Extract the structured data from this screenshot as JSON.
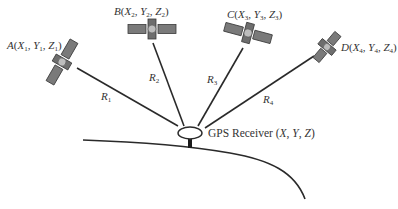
{
  "diagram": {
    "satellites": [
      {
        "id": "A",
        "label": "A(X1, Y1, Z1)",
        "letter": "A",
        "sub": "1",
        "cx": 62,
        "cy": 62,
        "angle": -60
      },
      {
        "id": "B",
        "label": "B(X2, Y2, Z2)",
        "letter": "B",
        "sub": "2",
        "cx": 152,
        "cy": 29,
        "angle": 0
      },
      {
        "id": "C",
        "label": "C(X3, Y3, Z3)",
        "letter": "C",
        "sub": "3",
        "cx": 248,
        "cy": 33,
        "angle": 15
      },
      {
        "id": "D",
        "label": "D(X4, Y4, Z4)",
        "letter": "D",
        "sub": "4",
        "cx": 327,
        "cy": 47,
        "angle": -50
      }
    ],
    "ranges": [
      {
        "id": "R1",
        "letter": "R",
        "sub": "1",
        "from": "A"
      },
      {
        "id": "R2",
        "letter": "R",
        "sub": "2",
        "from": "B"
      },
      {
        "id": "R3",
        "letter": "R",
        "sub": "3",
        "from": "C"
      },
      {
        "id": "R4",
        "letter": "R",
        "sub": "4",
        "from": "D"
      }
    ],
    "receiver": {
      "label_prefix": "GPS Receiver (",
      "x": "X",
      "sep1": ", ",
      "y": "Y",
      "sep2": ", ",
      "z": "Z",
      "suffix": ")"
    },
    "colors": {
      "line": "#2a2a2a",
      "satellite_panel": "#7a7a7a",
      "satellite_core": "#bdbdbd",
      "background": "#ffffff"
    }
  }
}
